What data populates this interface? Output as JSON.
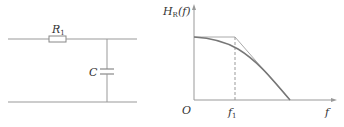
{
  "circuit": {
    "resistor_label": "R",
    "resistor_subscript": "1",
    "capacitor_label": "C"
  },
  "graph": {
    "y_axis_label_main": "H",
    "y_axis_label_sub": "R",
    "y_axis_label_rest": "(f)",
    "x_axis_label": "f",
    "origin_label": "O",
    "cutoff_label": "f",
    "cutoff_subscript": "1"
  },
  "colors": {
    "line": "#999999",
    "curve": "#777777",
    "text": "#333333"
  }
}
